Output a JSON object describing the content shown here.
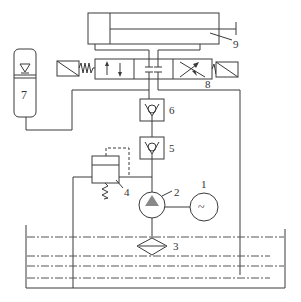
{
  "diagram": {
    "type": "hydraulic-circuit",
    "components": [
      {
        "id": "1",
        "label": "1",
        "symbol": "electric-motor"
      },
      {
        "id": "2",
        "label": "2",
        "symbol": "hydraulic-pump"
      },
      {
        "id": "3",
        "label": "3",
        "symbol": "filter"
      },
      {
        "id": "4",
        "label": "4",
        "symbol": "relief-valve"
      },
      {
        "id": "5",
        "label": "5",
        "symbol": "check-valve"
      },
      {
        "id": "6",
        "label": "6",
        "symbol": "check-valve"
      },
      {
        "id": "7",
        "label": "7",
        "symbol": "accumulator"
      },
      {
        "id": "8",
        "label": "8",
        "symbol": "solenoid-directional-valve"
      },
      {
        "id": "9",
        "label": "9",
        "symbol": "hydraulic-cylinder"
      }
    ],
    "motor_glyph": "~",
    "colors": {
      "line": "#3a3a3a",
      "pump_triangle": "#888888",
      "background": "#ffffff"
    }
  }
}
